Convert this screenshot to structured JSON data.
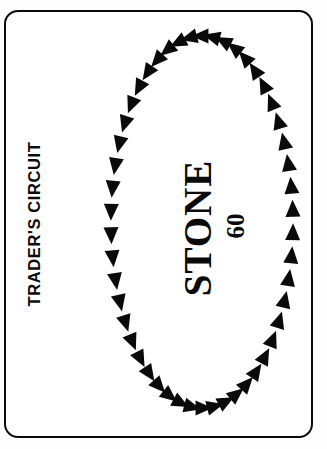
{
  "card": {
    "title": "TRADER'S CIRCUIT",
    "center_name": "STONE",
    "center_value": "60",
    "border_color": "#0a0a0a",
    "background_color": "#ffffff",
    "ink_color": "#0a0a0a"
  },
  "ring": {
    "name": "arrow-ring",
    "direction": "counterclockwise",
    "marker_shape": "triangle",
    "marker_count": 50,
    "marker_color": "#0a0a0a",
    "center_x": 202,
    "center_y": 222,
    "radius_x": 91,
    "radius_y": 186,
    "marker_length": 17,
    "marker_width": 15
  }
}
